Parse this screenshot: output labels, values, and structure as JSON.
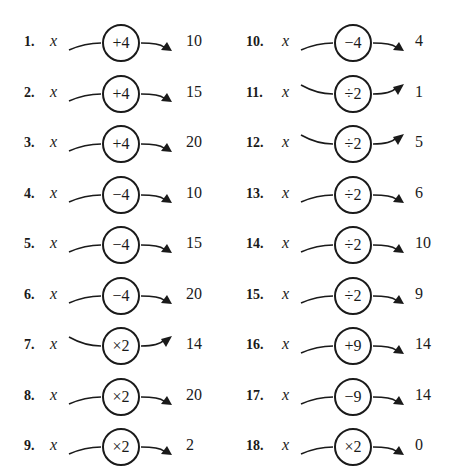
{
  "variable": "x",
  "problems": [
    {
      "number": "1.",
      "operation": "+4",
      "result": "10",
      "curve": "arc"
    },
    {
      "number": "2.",
      "operation": "+4",
      "result": "15",
      "curve": "arc"
    },
    {
      "number": "3.",
      "operation": "+4",
      "result": "20",
      "curve": "arc"
    },
    {
      "number": "4.",
      "operation": "−4",
      "result": "10",
      "curve": "arc"
    },
    {
      "number": "5.",
      "operation": "−4",
      "result": "15",
      "curve": "arc"
    },
    {
      "number": "6.",
      "operation": "−4",
      "result": "20",
      "curve": "arc"
    },
    {
      "number": "7.",
      "operation": "×2",
      "result": "14",
      "curve": "sag"
    },
    {
      "number": "8.",
      "operation": "×2",
      "result": "20",
      "curve": "arc"
    },
    {
      "number": "9.",
      "operation": "×2",
      "result": "2",
      "curve": "arc"
    },
    {
      "number": "10.",
      "operation": "−4",
      "result": "4",
      "curve": "arc"
    },
    {
      "number": "11.",
      "operation": "÷2",
      "result": "1",
      "curve": "sag"
    },
    {
      "number": "12.",
      "operation": "÷2",
      "result": "5",
      "curve": "sag"
    },
    {
      "number": "13.",
      "operation": "÷2",
      "result": "6",
      "curve": "arc"
    },
    {
      "number": "14.",
      "operation": "÷2",
      "result": "10",
      "curve": "arc"
    },
    {
      "number": "15.",
      "operation": "÷2",
      "result": "9",
      "curve": "arc"
    },
    {
      "number": "16.",
      "operation": "+9",
      "result": "14",
      "curve": "arc"
    },
    {
      "number": "17.",
      "operation": "−9",
      "result": "14",
      "curve": "arc"
    },
    {
      "number": "18.",
      "operation": "×2",
      "result": "0",
      "curve": "arc"
    }
  ]
}
